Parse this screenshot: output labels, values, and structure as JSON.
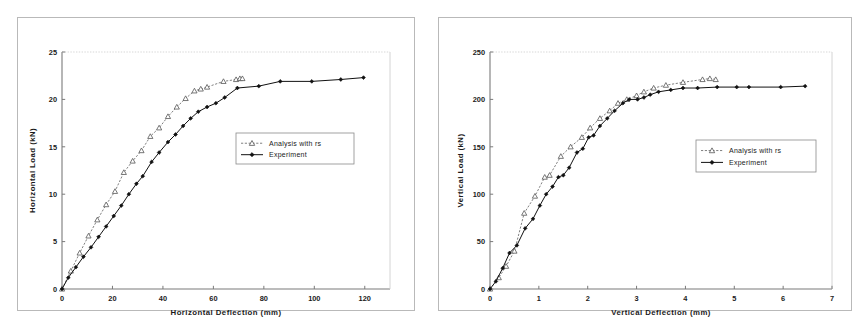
{
  "figure": {
    "background_color": "#ffffff",
    "frame_color": "#b9b9b9",
    "axis_color": "#7a7a7a",
    "series_colors": {
      "analysis": "#555555",
      "experiment": "#111111"
    }
  },
  "chart_data": [
    {
      "type": "line",
      "title": "",
      "xlabel": "Horizontal Deflection (mm)",
      "ylabel": "Horizontal Load (kN)",
      "xlim": [
        0,
        130
      ],
      "ylim": [
        0,
        25
      ],
      "xticks": [
        0,
        20,
        40,
        60,
        80,
        100,
        120
      ],
      "yticks": [
        0,
        5,
        10,
        15,
        20,
        25
      ],
      "grid": false,
      "legend_position": "center-right",
      "series": [
        {
          "name": "Analysis with rs",
          "marker": "open-triangle",
          "line": "dotted",
          "x": [
            0,
            3.5,
            7.0,
            10.5,
            14.0,
            17.5,
            21.0,
            24.5,
            28.0,
            31.5,
            35.0,
            38.5,
            42.0,
            45.5,
            49.0,
            52.5,
            55.0,
            57.5,
            64.0,
            69.0,
            70.5,
            71.5
          ],
          "y": [
            0,
            1.9,
            3.8,
            5.6,
            7.3,
            8.9,
            10.3,
            12.3,
            13.5,
            14.6,
            16.1,
            17.0,
            18.2,
            19.2,
            20.1,
            20.9,
            21.1,
            21.3,
            21.9,
            22.1,
            22.2,
            22.2
          ]
        },
        {
          "name": "Experiment",
          "marker": "filled-diamond",
          "line": "solid",
          "x": [
            0,
            2.5,
            5.5,
            8.5,
            11.5,
            14.5,
            17.5,
            20.5,
            23.5,
            26.5,
            29.5,
            32.0,
            35.5,
            38.5,
            42.0,
            45.0,
            48.0,
            51.0,
            54.0,
            57.5,
            61.0,
            64.5,
            69.5,
            78.0,
            86.5,
            99.0,
            110.5,
            119.5
          ],
          "y": [
            0,
            1.2,
            2.3,
            3.4,
            4.4,
            5.5,
            6.6,
            7.7,
            8.8,
            10.0,
            11.1,
            11.9,
            13.4,
            14.4,
            15.5,
            16.3,
            17.2,
            18.0,
            18.7,
            19.2,
            19.6,
            20.2,
            21.2,
            21.4,
            21.9,
            21.9,
            22.1,
            22.3
          ]
        }
      ]
    },
    {
      "type": "line",
      "title": "",
      "xlabel": "Vertical Deflection (mm)",
      "ylabel": "Vertical Load (kN)",
      "xlim": [
        0,
        7
      ],
      "ylim": [
        0,
        250
      ],
      "xticks": [
        0,
        1,
        2,
        3,
        4,
        5,
        6,
        7
      ],
      "yticks": [
        0,
        50,
        100,
        150,
        200,
        250
      ],
      "grid": false,
      "legend_position": "center-right",
      "series": [
        {
          "name": "Analysis with rs",
          "marker": "open-triangle",
          "line": "dotted",
          "x": [
            0,
            0.18,
            0.33,
            0.5,
            0.7,
            0.92,
            1.12,
            1.22,
            1.45,
            1.65,
            1.88,
            2.05,
            2.25,
            2.45,
            2.62,
            2.8,
            3.0,
            3.15,
            3.35,
            3.6,
            3.95,
            4.35,
            4.5,
            4.62
          ],
          "y": [
            0,
            12,
            24,
            40,
            80,
            98,
            118,
            120,
            140,
            150,
            160,
            170,
            180,
            188,
            196,
            200,
            204,
            208,
            212,
            215,
            218,
            221,
            222,
            221
          ]
        },
        {
          "name": "Experiment",
          "marker": "filled-diamond",
          "line": "solid",
          "x": [
            0,
            0.12,
            0.26,
            0.4,
            0.55,
            0.72,
            0.88,
            1.02,
            1.15,
            1.28,
            1.4,
            1.5,
            1.62,
            1.78,
            1.9,
            2.02,
            2.12,
            2.25,
            2.4,
            2.55,
            2.72,
            2.85,
            3.02,
            3.15,
            3.28,
            3.45,
            3.7,
            3.95,
            4.25,
            4.65,
            5.05,
            5.3,
            5.95,
            6.45
          ],
          "y": [
            0,
            8,
            22,
            38,
            46,
            64,
            74,
            88,
            100,
            108,
            118,
            120,
            128,
            144,
            148,
            160,
            162,
            172,
            180,
            188,
            196,
            200,
            200,
            202,
            205,
            208,
            210,
            212,
            212,
            213,
            213,
            213,
            213,
            214
          ]
        }
      ]
    }
  ],
  "left_chart": {
    "ylabel": "Horizontal Load (kN)",
    "xlabel": "Horizontal Deflection (mm)",
    "xtick_labels": [
      "0",
      "20",
      "40",
      "60",
      "80",
      "100",
      "120"
    ],
    "ytick_labels": [
      "0",
      "5",
      "10",
      "15",
      "20",
      "25"
    ],
    "legend": {
      "analysis_label": "Analysis with rs",
      "experiment_label": "Experiment"
    }
  },
  "right_chart": {
    "ylabel": "Vertical Load (kN)",
    "xlabel": "Vertical Deflection (mm)",
    "xtick_labels": [
      "0",
      "1",
      "2",
      "3",
      "4",
      "5",
      "6",
      "7"
    ],
    "ytick_labels": [
      "0",
      "50",
      "100",
      "150",
      "200",
      "250"
    ],
    "legend": {
      "analysis_label": "Analysis with rs",
      "experiment_label": "Experiment"
    }
  }
}
